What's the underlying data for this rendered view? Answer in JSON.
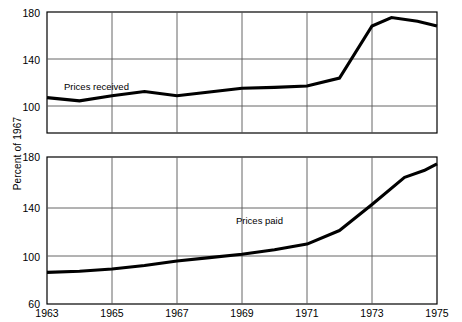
{
  "chart_data": [
    {
      "type": "line",
      "title": "",
      "xlabel": "",
      "ylabel": "Percent of 1967",
      "xlim": [
        1963,
        1975
      ],
      "ylim": [
        60,
        190
      ],
      "ytick_labels": [
        "180",
        "140",
        "100"
      ],
      "yticks": [
        180,
        140,
        100
      ],
      "xtick_labels": [
        "1963",
        "1965",
        "1967",
        "1969",
        "1971",
        "1973",
        "1975"
      ],
      "xticks": [
        1963,
        1965,
        1967,
        1969,
        1971,
        1973,
        1975
      ],
      "grid": true,
      "legend_position": "inline-annotation",
      "series": [
        {
          "name": "Prices received",
          "x": [
            1963,
            1964,
            1965,
            1966,
            1967,
            1968,
            1969,
            1970,
            1971,
            1972,
            1973,
            1973.6,
            1974.4,
            1975
          ],
          "values": [
            98,
            94.5,
            100,
            104.5,
            100,
            104,
            108,
            109,
            110.5,
            119,
            175,
            184,
            180,
            175
          ]
        }
      ]
    },
    {
      "type": "line",
      "title": "",
      "xlabel": "",
      "ylabel": "Percent of 1967",
      "xlim": [
        1963,
        1975
      ],
      "ylim": [
        60,
        190
      ],
      "ytick_labels": [
        "180",
        "140",
        "100",
        "60"
      ],
      "yticks": [
        180,
        140,
        100,
        60
      ],
      "xtick_labels": [
        "1963",
        "1965",
        "1967",
        "1969",
        "1971",
        "1973",
        "1975"
      ],
      "xticks": [
        1963,
        1965,
        1967,
        1969,
        1971,
        1973,
        1975
      ],
      "grid": true,
      "legend_position": "inline-annotation",
      "series": [
        {
          "name": "Prices paid",
          "x": [
            1963,
            1964,
            1965,
            1966,
            1967,
            1968,
            1969,
            1970,
            1971,
            1972,
            1973,
            1974,
            1974.6,
            1975
          ],
          "values": [
            88,
            89,
            91,
            94,
            98,
            101,
            104,
            108,
            113,
            125,
            148,
            172,
            178,
            184
          ]
        }
      ]
    }
  ],
  "axis": {
    "vertical_label": "Percent of 1967"
  },
  "top_chart": {
    "ytick_labels": [
      "180",
      "140",
      "100"
    ],
    "series_label": "Prices received"
  },
  "bottom_chart": {
    "ytick_labels": [
      "180",
      "140",
      "100",
      "60"
    ],
    "series_label": "Prices paid"
  },
  "xtick_labels": [
    "1963",
    "1965",
    "1967",
    "1969",
    "1971",
    "1973",
    "1975"
  ]
}
